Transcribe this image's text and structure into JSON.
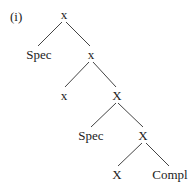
{
  "diagram": {
    "label": "(i)",
    "type": "syntax-tree",
    "nodes": [
      {
        "id": "n1",
        "text": "x"
      },
      {
        "id": "n2",
        "text": "Spec"
      },
      {
        "id": "n3",
        "text": "x"
      },
      {
        "id": "n4",
        "text": "x"
      },
      {
        "id": "n5",
        "text": "X"
      },
      {
        "id": "n6",
        "text": "Spec"
      },
      {
        "id": "n7",
        "text": "X"
      },
      {
        "id": "n8",
        "text": "X"
      },
      {
        "id": "n9",
        "text": "Compl"
      }
    ],
    "edges": [
      [
        "n1",
        "n2"
      ],
      [
        "n1",
        "n3"
      ],
      [
        "n3",
        "n4"
      ],
      [
        "n3",
        "n5"
      ],
      [
        "n5",
        "n6"
      ],
      [
        "n5",
        "n7"
      ],
      [
        "n7",
        "n8"
      ],
      [
        "n7",
        "n9"
      ]
    ]
  }
}
